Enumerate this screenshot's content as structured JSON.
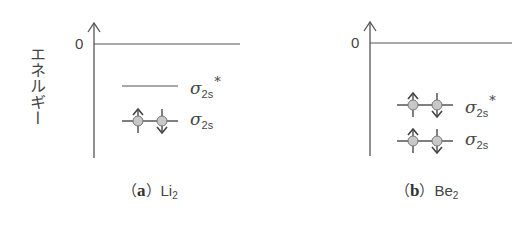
{
  "y_axis_label": "エネルギー",
  "colors": {
    "line": "#555555",
    "electron_fill": "#c8c8c8",
    "electron_stroke": "#777777"
  },
  "panels": [
    {
      "id": "a",
      "zero_label": "0",
      "caption_letter": "a",
      "caption_molecule": "Li",
      "caption_subscript": "2",
      "levels": [
        {
          "name": "σ2s*",
          "symbol": "σ",
          "subscript": "2s",
          "superscript": "*",
          "electrons": 0
        },
        {
          "name": "σ2s",
          "symbol": "σ",
          "subscript": "2s",
          "superscript": "",
          "electrons": 2
        }
      ]
    },
    {
      "id": "b",
      "zero_label": "0",
      "caption_letter": "b",
      "caption_molecule": "Be",
      "caption_subscript": "2",
      "levels": [
        {
          "name": "σ2s*",
          "symbol": "σ",
          "subscript": "2s",
          "superscript": "*",
          "electrons": 2
        },
        {
          "name": "σ2s",
          "symbol": "σ",
          "subscript": "2s",
          "superscript": "",
          "electrons": 2
        }
      ]
    }
  ]
}
